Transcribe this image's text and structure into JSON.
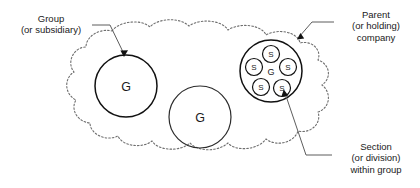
{
  "diagram": {
    "colors": {
      "cloud_stroke": "#6e6e6e",
      "circle_stroke": "#111111",
      "leader_stroke": "#5d5d5d",
      "text": "#1a1a1a",
      "background": "#ffffff"
    },
    "callouts": {
      "group": {
        "name": "group-callout",
        "lines": [
          "Group",
          "(or subsidiary)"
        ],
        "line1": "Group",
        "line2": "(or subsidiary)"
      },
      "parent": {
        "name": "parent-callout",
        "lines": [
          "Parent",
          "(or holding)",
          "company"
        ],
        "line1": "Parent",
        "line2": "(or holding)",
        "line3": "company"
      },
      "section": {
        "name": "section-callout",
        "lines": [
          "Section",
          "(or division)",
          "within group"
        ],
        "line1": "Section",
        "line2": "(or division)",
        "line3": "within group"
      }
    },
    "shapes": {
      "cloud": {
        "name": "parent-company-cloud",
        "style": "dotted outline cloud"
      },
      "group_left": {
        "name": "group-circle-left",
        "label": "G",
        "cx": 126,
        "cy": 86,
        "r": 31
      },
      "group_middle": {
        "name": "group-circle-middle",
        "label": "G",
        "cx": 200,
        "cy": 117,
        "r": 31
      },
      "group_sections": {
        "name": "group-circle-with-sections",
        "center_label": "G",
        "cx": 271,
        "cy": 71,
        "r": 31,
        "section_label": "S",
        "section_count": 5,
        "sections": [
          {
            "name": "section-top",
            "label": "S",
            "cx": 271,
            "cy": 54,
            "r": 8.5
          },
          {
            "name": "section-left",
            "label": "S",
            "cx": 254,
            "cy": 67,
            "r": 8.5
          },
          {
            "name": "section-right",
            "label": "S",
            "cx": 288,
            "cy": 67,
            "r": 8.5
          },
          {
            "name": "section-bottom-left",
            "label": "S",
            "cx": 261,
            "cy": 87,
            "r": 8.5
          },
          {
            "name": "section-bottom-right",
            "label": "S",
            "cx": 282,
            "cy": 88,
            "r": 8.5
          }
        ]
      }
    }
  }
}
